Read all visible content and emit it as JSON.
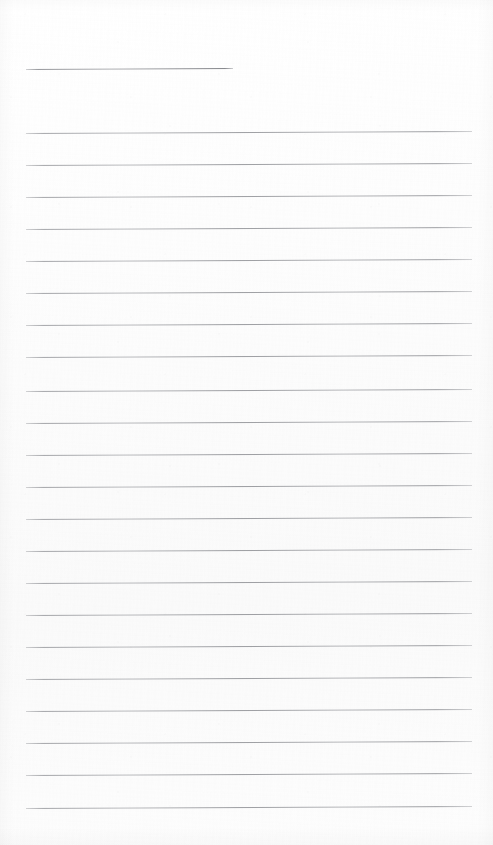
{
  "document": {
    "kind": "lined-paper",
    "title": "",
    "body_text": "",
    "note": "",
    "page_width": 493,
    "page_height": 845,
    "paper_color": "#fdfdfd",
    "rule_color": "#6e7076"
  },
  "ruling": {
    "left_margin": 26,
    "right_edge": 472,
    "line_spacing": 32,
    "first_line_y": 69,
    "body_start_y": 133,
    "slant_deg": -0.25,
    "short_rule_end_x": 233,
    "total_rules": 23
  },
  "lines": [
    {
      "id": "rule-title",
      "y": 69,
      "x1": 26,
      "x2": 233,
      "short": true,
      "text": ""
    },
    {
      "id": "rule-01",
      "y": 133,
      "x1": 26,
      "x2": 472,
      "short": false,
      "text": ""
    },
    {
      "id": "rule-02",
      "y": 165,
      "x1": 26,
      "x2": 472,
      "short": false,
      "text": ""
    },
    {
      "id": "rule-03",
      "y": 197,
      "x1": 26,
      "x2": 472,
      "short": false,
      "text": ""
    },
    {
      "id": "rule-04",
      "y": 229,
      "x1": 26,
      "x2": 472,
      "short": false,
      "text": ""
    },
    {
      "id": "rule-05",
      "y": 261,
      "x1": 26,
      "x2": 472,
      "short": false,
      "text": ""
    },
    {
      "id": "rule-06",
      "y": 293,
      "x1": 26,
      "x2": 472,
      "short": false,
      "text": ""
    },
    {
      "id": "rule-07",
      "y": 325,
      "x1": 26,
      "x2": 472,
      "short": false,
      "text": ""
    },
    {
      "id": "rule-08",
      "y": 357,
      "x1": 26,
      "x2": 472,
      "short": false,
      "text": ""
    },
    {
      "id": "rule-09",
      "y": 391,
      "x1": 26,
      "x2": 472,
      "short": false,
      "text": ""
    },
    {
      "id": "rule-10",
      "y": 423,
      "x1": 26,
      "x2": 472,
      "short": false,
      "text": ""
    },
    {
      "id": "rule-11",
      "y": 455,
      "x1": 26,
      "x2": 472,
      "short": false,
      "text": ""
    },
    {
      "id": "rule-12",
      "y": 487,
      "x1": 26,
      "x2": 472,
      "short": false,
      "text": ""
    },
    {
      "id": "rule-13",
      "y": 519,
      "x1": 26,
      "x2": 472,
      "short": false,
      "text": ""
    },
    {
      "id": "rule-14",
      "y": 551,
      "x1": 26,
      "x2": 472,
      "short": false,
      "text": ""
    },
    {
      "id": "rule-15",
      "y": 583,
      "x1": 26,
      "x2": 472,
      "short": false,
      "text": ""
    },
    {
      "id": "rule-16",
      "y": 615,
      "x1": 26,
      "x2": 472,
      "short": false,
      "text": ""
    },
    {
      "id": "rule-17",
      "y": 647,
      "x1": 26,
      "x2": 472,
      "short": false,
      "text": ""
    },
    {
      "id": "rule-18",
      "y": 679,
      "x1": 26,
      "x2": 472,
      "short": false,
      "text": ""
    },
    {
      "id": "rule-19",
      "y": 711,
      "x1": 26,
      "x2": 472,
      "short": false,
      "text": ""
    },
    {
      "id": "rule-20",
      "y": 743,
      "x1": 26,
      "x2": 472,
      "short": false,
      "text": ""
    },
    {
      "id": "rule-21",
      "y": 775,
      "x1": 26,
      "x2": 472,
      "short": false,
      "text": ""
    },
    {
      "id": "rule-22",
      "y": 808,
      "x1": 26,
      "x2": 472,
      "short": false,
      "text": ""
    }
  ]
}
